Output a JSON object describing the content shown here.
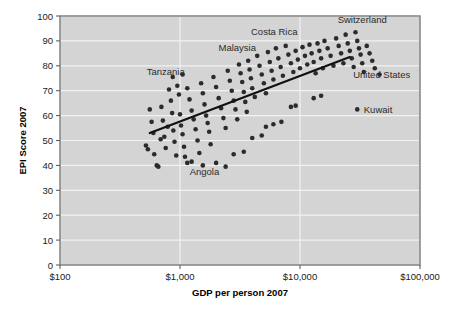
{
  "chart_data": {
    "type": "scatter",
    "title": "",
    "xlabel": "GDP per person 2007",
    "ylabel": "EPI Score 2007",
    "xscale": "log",
    "xlim": [
      100,
      100000
    ],
    "ylim": [
      0,
      100
    ],
    "grid": true,
    "legend": null,
    "xticks": [
      {
        "value": 100,
        "label": "$100"
      },
      {
        "value": 1000,
        "label": "$1,000"
      },
      {
        "value": 10000,
        "label": "$10,000"
      },
      {
        "value": 100000,
        "label": "$100,000"
      }
    ],
    "yticks": [
      {
        "value": 0,
        "label": "0"
      },
      {
        "value": 10,
        "label": "10"
      },
      {
        "value": 20,
        "label": "20"
      },
      {
        "value": 30,
        "label": "30"
      },
      {
        "value": 40,
        "label": "40"
      },
      {
        "value": 50,
        "label": "50"
      },
      {
        "value": 60,
        "label": "60"
      },
      {
        "value": 70,
        "label": "70"
      },
      {
        "value": 80,
        "label": "80"
      },
      {
        "value": 90,
        "label": "90"
      },
      {
        "value": 100,
        "label": "100"
      }
    ],
    "trendline": {
      "type": "linear-on-log-x",
      "x_start": 560,
      "y_start": 53.0,
      "x_end": 26000,
      "y_end": 83.5,
      "color": "#111111"
    },
    "annotations": [
      {
        "text": "Tanzania",
        "x": 760,
        "y": 76.5,
        "anchor": "middle"
      },
      {
        "text": "Malaysia",
        "x": 3000,
        "y": 86.0,
        "anchor": "middle"
      },
      {
        "text": "Costa Rica",
        "x": 6100,
        "y": 92.5,
        "anchor": "middle"
      },
      {
        "text": "Switzerland",
        "x": 33000,
        "y": 97.0,
        "anchor": "middle"
      },
      {
        "text": "United States",
        "x": 48000,
        "y": 75.0,
        "anchor": "middle"
      },
      {
        "text": "Kuwait",
        "x": 34000,
        "y": 61.0,
        "anchor": "start"
      },
      {
        "text": "Angola",
        "x": 1600,
        "y": 36.0,
        "anchor": "middle"
      }
    ],
    "point_color": "#2b2b2b",
    "plot_background": "#d4d4d4",
    "gridline_color": "#f2f2f2",
    "points": [
      {
        "x": 520,
        "y": 48.0
      },
      {
        "x": 540,
        "y": 46.5
      },
      {
        "x": 560,
        "y": 62.5
      },
      {
        "x": 580,
        "y": 57.5
      },
      {
        "x": 600,
        "y": 53.0
      },
      {
        "x": 610,
        "y": 44.5
      },
      {
        "x": 640,
        "y": 40.0
      },
      {
        "x": 660,
        "y": 39.5
      },
      {
        "x": 690,
        "y": 50.5
      },
      {
        "x": 700,
        "y": 63.5
      },
      {
        "x": 720,
        "y": 58.0
      },
      {
        "x": 740,
        "y": 51.5
      },
      {
        "x": 760,
        "y": 47.0
      },
      {
        "x": 790,
        "y": 55.5
      },
      {
        "x": 810,
        "y": 70.5
      },
      {
        "x": 840,
        "y": 66.0
      },
      {
        "x": 860,
        "y": 61.0
      },
      {
        "x": 880,
        "y": 54.0
      },
      {
        "x": 900,
        "y": 49.5
      },
      {
        "x": 930,
        "y": 44.0
      },
      {
        "x": 950,
        "y": 72.0
      },
      {
        "x": 980,
        "y": 68.5
      },
      {
        "x": 1000,
        "y": 60.5
      },
      {
        "x": 1020,
        "y": 56.0
      },
      {
        "x": 1050,
        "y": 52.5
      },
      {
        "x": 1080,
        "y": 47.5
      },
      {
        "x": 1100,
        "y": 43.5
      },
      {
        "x": 1150,
        "y": 71.0
      },
      {
        "x": 1200,
        "y": 66.5
      },
      {
        "x": 1250,
        "y": 62.0
      },
      {
        "x": 1300,
        "y": 58.5
      },
      {
        "x": 1350,
        "y": 54.5
      },
      {
        "x": 1400,
        "y": 50.0
      },
      {
        "x": 1450,
        "y": 45.0
      },
      {
        "x": 1500,
        "y": 73.0
      },
      {
        "x": 1550,
        "y": 69.0
      },
      {
        "x": 1600,
        "y": 64.5
      },
      {
        "x": 1650,
        "y": 60.0
      },
      {
        "x": 1700,
        "y": 57.0
      },
      {
        "x": 1750,
        "y": 53.5
      },
      {
        "x": 1800,
        "y": 48.5
      },
      {
        "x": 1550,
        "y": 40.0
      },
      {
        "x": 1900,
        "y": 75.5
      },
      {
        "x": 2000,
        "y": 71.5
      },
      {
        "x": 2100,
        "y": 67.0
      },
      {
        "x": 2200,
        "y": 63.0
      },
      {
        "x": 2300,
        "y": 59.0
      },
      {
        "x": 2400,
        "y": 55.0
      },
      {
        "x": 2500,
        "y": 78.0
      },
      {
        "x": 2600,
        "y": 74.0
      },
      {
        "x": 2700,
        "y": 70.0
      },
      {
        "x": 2800,
        "y": 66.0
      },
      {
        "x": 2900,
        "y": 62.5
      },
      {
        "x": 3000,
        "y": 58.5
      },
      {
        "x": 3100,
        "y": 80.5
      },
      {
        "x": 3200,
        "y": 77.0
      },
      {
        "x": 3300,
        "y": 73.5
      },
      {
        "x": 3400,
        "y": 69.5
      },
      {
        "x": 3500,
        "y": 65.5
      },
      {
        "x": 3600,
        "y": 61.5
      },
      {
        "x": 3700,
        "y": 82.0
      },
      {
        "x": 3800,
        "y": 78.5
      },
      {
        "x": 3900,
        "y": 75.0
      },
      {
        "x": 4000,
        "y": 71.0
      },
      {
        "x": 4200,
        "y": 67.5
      },
      {
        "x": 4400,
        "y": 84.0
      },
      {
        "x": 4600,
        "y": 80.0
      },
      {
        "x": 4800,
        "y": 76.5
      },
      {
        "x": 5000,
        "y": 73.0
      },
      {
        "x": 5200,
        "y": 69.0
      },
      {
        "x": 5400,
        "y": 85.5
      },
      {
        "x": 5600,
        "y": 81.5
      },
      {
        "x": 5800,
        "y": 78.0
      },
      {
        "x": 6000,
        "y": 74.5
      },
      {
        "x": 6300,
        "y": 87.0
      },
      {
        "x": 6600,
        "y": 83.0
      },
      {
        "x": 6900,
        "y": 79.5
      },
      {
        "x": 7200,
        "y": 76.0
      },
      {
        "x": 7600,
        "y": 88.0
      },
      {
        "x": 8000,
        "y": 84.5
      },
      {
        "x": 8400,
        "y": 81.0
      },
      {
        "x": 8800,
        "y": 77.5
      },
      {
        "x": 9200,
        "y": 86.0
      },
      {
        "x": 9600,
        "y": 82.5
      },
      {
        "x": 10000,
        "y": 79.0
      },
      {
        "x": 10500,
        "y": 87.5
      },
      {
        "x": 11000,
        "y": 84.0
      },
      {
        "x": 11500,
        "y": 80.5
      },
      {
        "x": 12000,
        "y": 88.5
      },
      {
        "x": 12500,
        "y": 85.0
      },
      {
        "x": 13000,
        "y": 81.5
      },
      {
        "x": 13500,
        "y": 77.0
      },
      {
        "x": 14000,
        "y": 89.0
      },
      {
        "x": 14500,
        "y": 86.0
      },
      {
        "x": 15000,
        "y": 83.0
      },
      {
        "x": 15500,
        "y": 79.0
      },
      {
        "x": 16000,
        "y": 90.0
      },
      {
        "x": 17000,
        "y": 87.0
      },
      {
        "x": 18000,
        "y": 84.0
      },
      {
        "x": 19000,
        "y": 80.0
      },
      {
        "x": 20000,
        "y": 91.0
      },
      {
        "x": 21000,
        "y": 88.0
      },
      {
        "x": 22000,
        "y": 85.0
      },
      {
        "x": 23000,
        "y": 81.0
      },
      {
        "x": 24000,
        "y": 92.5
      },
      {
        "x": 25000,
        "y": 89.0
      },
      {
        "x": 26000,
        "y": 86.0
      },
      {
        "x": 27000,
        "y": 83.0
      },
      {
        "x": 28000,
        "y": 79.5
      },
      {
        "x": 29000,
        "y": 93.5
      },
      {
        "x": 30000,
        "y": 90.0
      },
      {
        "x": 31000,
        "y": 87.0
      },
      {
        "x": 32000,
        "y": 84.5
      },
      {
        "x": 33000,
        "y": 81.0
      },
      {
        "x": 34000,
        "y": 77.5
      },
      {
        "x": 36000,
        "y": 88.0
      },
      {
        "x": 38000,
        "y": 85.0
      },
      {
        "x": 40000,
        "y": 82.0
      },
      {
        "x": 42000,
        "y": 79.0
      },
      {
        "x": 46000,
        "y": 76.5
      },
      {
        "x": 30000,
        "y": 62.5
      },
      {
        "x": 2400,
        "y": 39.5
      },
      {
        "x": 2000,
        "y": 41.0
      },
      {
        "x": 1250,
        "y": 41.5
      },
      {
        "x": 1150,
        "y": 41.0
      },
      {
        "x": 2800,
        "y": 44.5
      },
      {
        "x": 3400,
        "y": 45.5
      },
      {
        "x": 5200,
        "y": 55.5
      },
      {
        "x": 6000,
        "y": 56.5
      },
      {
        "x": 7000,
        "y": 57.5
      },
      {
        "x": 8400,
        "y": 63.5
      },
      {
        "x": 9200,
        "y": 64.0
      },
      {
        "x": 13000,
        "y": 67.0
      },
      {
        "x": 15000,
        "y": 68.0
      },
      {
        "x": 4800,
        "y": 52.0
      },
      {
        "x": 4000,
        "y": 51.0
      },
      {
        "x": 870,
        "y": 75.5
      },
      {
        "x": 1050,
        "y": 76.5
      }
    ]
  }
}
